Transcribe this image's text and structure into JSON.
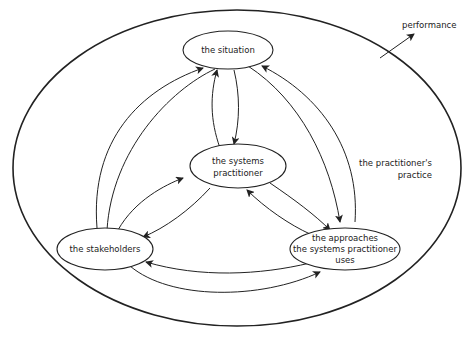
{
  "diagram": {
    "nodes": {
      "situation": "the situation",
      "practitioner_l1": "the systems",
      "practitioner_l2": "practitioner",
      "stakeholders": "the stakeholders",
      "approaches_l1": "the approaches",
      "approaches_l2": "the systems practitioner",
      "approaches_l3": "uses"
    },
    "boundary_label_l1": "the practitioner's",
    "boundary_label_l2": "practice",
    "output_label": "performance",
    "colors": {
      "stroke": "#222222",
      "background": "#ffffff"
    }
  }
}
